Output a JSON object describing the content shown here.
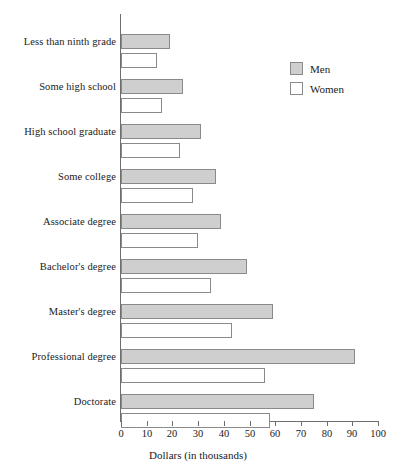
{
  "chart_data": {
    "type": "bar",
    "orientation": "horizontal",
    "title": "",
    "xlabel": "Dollars (in thousands)",
    "ylabel": "",
    "xlim": [
      0,
      100
    ],
    "xticks": [
      0,
      10,
      20,
      30,
      40,
      50,
      60,
      70,
      80,
      90,
      100
    ],
    "grid": false,
    "legend_position": "upper right",
    "categories": [
      "Less than ninth grade",
      "Some high school",
      "High school graduate",
      "Some college",
      "Associate degree",
      "Bachelor's degree",
      "Master's degree",
      "Professional degree",
      "Doctorate"
    ],
    "series": [
      {
        "name": "Men",
        "color": "#cfcfcf",
        "values": [
          19,
          24,
          31,
          37,
          39,
          49,
          59,
          91,
          75
        ]
      },
      {
        "name": "Women",
        "color": "#ffffff",
        "values": [
          14,
          16,
          23,
          28,
          30,
          35,
          43,
          56,
          58
        ]
      }
    ]
  },
  "legend": {
    "entries": [
      {
        "label": "Men",
        "swatch": "men"
      },
      {
        "label": "Women",
        "swatch": "women"
      }
    ]
  },
  "axis": {
    "x_title": "Dollars (in thousands)",
    "tick_labels": [
      "0",
      "10",
      "20",
      "30",
      "40",
      "50",
      "60",
      "70",
      "80",
      "90",
      "100"
    ]
  }
}
